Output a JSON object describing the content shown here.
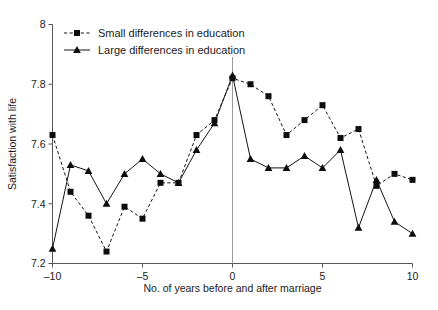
{
  "chart_data": {
    "type": "line",
    "title": "",
    "xlabel": "No. of years before and after marriage",
    "ylabel": "Satisfaction with life",
    "xlim": [
      -10,
      10
    ],
    "ylim": [
      7.2,
      8
    ],
    "xticks": [
      -10,
      -5,
      0,
      5,
      10
    ],
    "xtick_labels": [
      "–10",
      "–5",
      "0",
      "5",
      "10"
    ],
    "yticks": [
      7.2,
      7.4,
      7.6,
      7.8,
      8
    ],
    "ytick_labels": [
      "7.2",
      "7.4",
      "7.6",
      "7.8",
      "8"
    ],
    "grid": false,
    "legend_position": "top-left",
    "annotations": [
      {
        "name": "marriage-reference-line",
        "type": "vline",
        "x": 0,
        "label": ""
      }
    ],
    "x": [
      -10,
      -9,
      -8,
      -7,
      -6,
      -5,
      -4,
      -3,
      -2,
      -1,
      0,
      1,
      2,
      3,
      4,
      5,
      6,
      7,
      8,
      9,
      10
    ],
    "series": [
      {
        "name": "Small differences in education",
        "marker": "square",
        "linestyle": "dashed",
        "color": "#0d0d0d",
        "values": [
          7.63,
          7.44,
          7.36,
          7.24,
          7.39,
          7.35,
          7.47,
          7.47,
          7.63,
          7.68,
          7.82,
          7.8,
          7.76,
          7.63,
          7.68,
          7.73,
          7.62,
          7.65,
          7.46,
          7.5,
          7.48
        ]
      },
      {
        "name": "Large differences in education",
        "marker": "triangle",
        "linestyle": "solid",
        "color": "#0d0d0d",
        "values": [
          7.25,
          7.53,
          7.51,
          7.4,
          7.5,
          7.55,
          7.5,
          7.47,
          7.58,
          7.67,
          7.83,
          7.55,
          7.52,
          7.52,
          7.56,
          7.52,
          7.58,
          7.32,
          7.48,
          7.34,
          7.3
        ]
      }
    ]
  },
  "legend": {
    "items": [
      {
        "label": "Small differences in education",
        "marker": "square",
        "linestyle": "dashed"
      },
      {
        "label": "Large differences in education",
        "marker": "triangle",
        "linestyle": "solid"
      }
    ]
  },
  "axes": {
    "x_title": "No. of years before and after marriage",
    "y_title": "Satisfaction with life"
  }
}
